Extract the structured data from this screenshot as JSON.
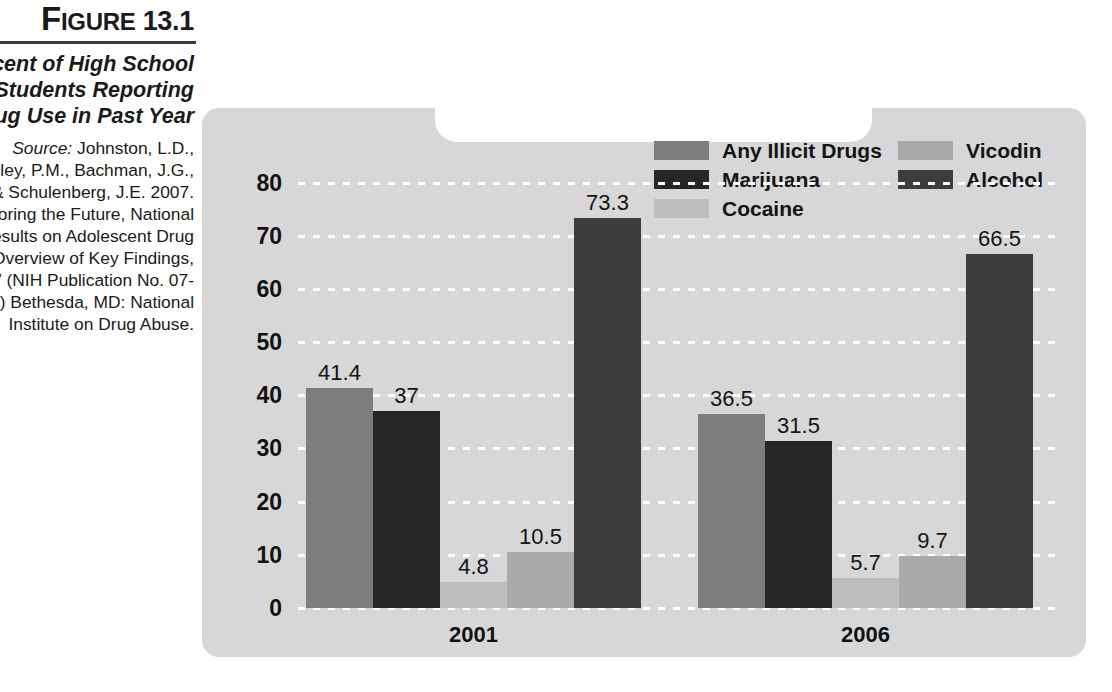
{
  "caption": {
    "figure_number_prefix": "F",
    "figure_number_rest": "IGURE",
    "figure_number": "13.1",
    "title": "Percent of High School Students Reporting Drug Use in Past Year",
    "source_label": "Source:",
    "source_text": " Johnston, L.D., O'Malley, P.M., Bachman, J.G., & Schulenberg, J.E. 2007. “Monitoring the Future, National Results on Adolescent Drug Use: Overview of Key Findings, 2006.” (NIH Publication No. 07-6202) Bethesda, MD: National Institute on Drug Abuse."
  },
  "legend": {
    "items": [
      {
        "label": "Any Illicit Drugs",
        "color": "#7d7d7d"
      },
      {
        "label": "Vicodin",
        "color": "#a9a9a9"
      },
      {
        "label": "Marijuana",
        "color": "#262626"
      },
      {
        "label": "Alcohol",
        "color": "#3c3c3c"
      },
      {
        "label": "Cocaine",
        "color": "#bdbdbd"
      }
    ]
  },
  "chart_data": {
    "type": "bar",
    "title": "Percent of High School Students Reporting Drug Use in Past Year",
    "xlabel": "",
    "ylabel": "",
    "ylim": [
      0,
      85
    ],
    "yticks": [
      0,
      10,
      20,
      30,
      40,
      50,
      60,
      70,
      80
    ],
    "grid": true,
    "legend_position": "top",
    "categories": [
      "2001",
      "2006"
    ],
    "series": [
      {
        "name": "Any Illicit Drugs",
        "color": "#7d7d7d",
        "values": [
          41.4,
          36.5
        ],
        "labels": [
          "41.4",
          "36.5"
        ]
      },
      {
        "name": "Marijuana",
        "color": "#262626",
        "values": [
          37,
          31.5
        ],
        "labels": [
          "37",
          "31.5"
        ]
      },
      {
        "name": "Cocaine",
        "color": "#bdbdbd",
        "values": [
          4.8,
          5.7
        ],
        "labels": [
          "4.8",
          "5.7"
        ]
      },
      {
        "name": "Vicodin",
        "color": "#a9a9a9",
        "values": [
          10.5,
          9.7
        ],
        "labels": [
          "10.5",
          "9.7"
        ]
      },
      {
        "name": "Alcohol",
        "color": "#3c3c3c",
        "values": [
          73.3,
          66.5
        ],
        "labels": [
          "73.3",
          "66.5"
        ]
      }
    ]
  }
}
